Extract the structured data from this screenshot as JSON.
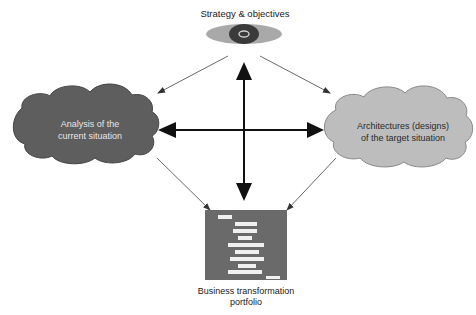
{
  "diagram": {
    "nodes": {
      "strategy": {
        "label": "Strategy & objectives",
        "icon": "eye-icon"
      },
      "current": {
        "line1": "Analysis of the",
        "line2": "current situation",
        "fill": "#5e5e5e",
        "text_color": "#e6e6e6"
      },
      "target": {
        "line1": "Architectures (designs)",
        "line2": "of the target situation",
        "fill": "#bdbdbd",
        "text_color": "#2a2a2a"
      },
      "portfolio": {
        "line1": "Business transformation",
        "line2": "portfolio",
        "icon": "gantt-chart-icon",
        "fill": "#6a6a6a"
      }
    },
    "edges": [
      {
        "from": "strategy",
        "to": "current",
        "style": "thin-arrow"
      },
      {
        "from": "strategy",
        "to": "target",
        "style": "thin-arrow"
      },
      {
        "from": "current",
        "to": "portfolio",
        "style": "thin-arrow"
      },
      {
        "from": "target",
        "to": "portfolio",
        "style": "thin-arrow"
      },
      {
        "from": "strategy",
        "to": "portfolio",
        "style": "bold-double-arrow"
      },
      {
        "from": "current",
        "to": "target",
        "style": "bold-double-arrow"
      }
    ]
  }
}
